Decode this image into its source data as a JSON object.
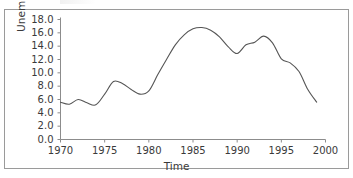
{
  "figure": {
    "background": "#ffffff",
    "border_color": "#9a9a9a",
    "line_color": "#555555",
    "text_color": "#3a3a3a"
  },
  "axis": {
    "ylabel_text": "Unemployment Rate",
    "ylabel_pct": "%",
    "xlabel_text": "Time"
  },
  "chart_data": {
    "type": "line",
    "title": "",
    "xlabel": "Time",
    "ylabel": "Unemployment Rate %",
    "xlim": [
      1970,
      2000
    ],
    "ylim": [
      0.0,
      18.0
    ],
    "xticks": [
      1970,
      1975,
      1980,
      1985,
      1990,
      1995,
      2000
    ],
    "xtick_labels": [
      "1970",
      "1975",
      "1980",
      "1985",
      "1990",
      "1995",
      "2000"
    ],
    "yticks": [
      0.0,
      2.0,
      4.0,
      6.0,
      8.0,
      10.0,
      12.0,
      14.0,
      16.0,
      18.0
    ],
    "ytick_labels": [
      "0.0",
      "2.0",
      "4.0",
      "6.0",
      "8.0",
      "10.0",
      "12.0",
      "14.0",
      "16.0",
      "18.0"
    ],
    "grid": false,
    "legend": false,
    "legend_position": "none",
    "series": [
      {
        "name": "Unemployment Rate",
        "color": "#555555",
        "x": [
          1970,
          1971,
          1972,
          1973,
          1974,
          1975,
          1976,
          1977,
          1978,
          1979,
          1980,
          1981,
          1982,
          1983,
          1984,
          1985,
          1986,
          1987,
          1988,
          1989,
          1990,
          1991,
          1992,
          1993,
          1994,
          1995,
          1996,
          1997,
          1998,
          1999
        ],
        "values": [
          5.6,
          5.3,
          6.0,
          5.5,
          5.2,
          6.8,
          8.7,
          8.4,
          7.5,
          6.8,
          7.3,
          9.7,
          12.0,
          14.2,
          15.7,
          16.6,
          16.8,
          16.4,
          15.4,
          13.9,
          12.9,
          14.2,
          14.6,
          15.5,
          14.5,
          12.1,
          11.5,
          10.2,
          7.5,
          5.6
        ]
      }
    ]
  }
}
